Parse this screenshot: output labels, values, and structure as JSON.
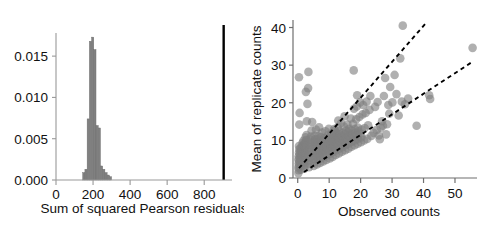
{
  "figure": {
    "panels": [
      "histogram-panel",
      "scatter-panel"
    ]
  },
  "chart_data": [
    {
      "type": "bar",
      "name": "histogram-of-sum-of-squared-pearson-residuals",
      "title": "",
      "xlabel": "Sum of squared Pearson residuals",
      "ylabel": "",
      "xlim": [
        0,
        950
      ],
      "ylim": [
        0,
        0.0178
      ],
      "xticks": [
        0,
        200,
        400,
        600,
        800
      ],
      "xticklabels": [
        "0",
        "200",
        "400",
        "600",
        "800"
      ],
      "yticks": [
        0.0,
        0.005,
        0.01,
        0.015
      ],
      "yticklabels": [
        "0.000",
        "0.005",
        "0.010",
        "0.015"
      ],
      "grid": false,
      "legend": null,
      "bar_color": "#808080",
      "bin_width": 12,
      "bin_left_edges": [
        144,
        156,
        168,
        180,
        192,
        204,
        216,
        228,
        240,
        252,
        264,
        276,
        288
      ],
      "values": [
        0.0009,
        0.0013,
        0.0074,
        0.0168,
        0.0173,
        0.0158,
        0.0066,
        0.0063,
        0.0017,
        0.0013,
        0.0009,
        0.0006,
        0.0004
      ],
      "annotations": [
        {
          "name": "observed-statistic-line",
          "type": "vertical-line",
          "x": 905,
          "color": "#000000",
          "label": ""
        }
      ]
    },
    {
      "type": "scatter",
      "name": "mean-replicate-counts-vs-observed-counts",
      "title": "",
      "xlabel": "Observed counts",
      "ylabel": "Mean of replicate counts",
      "xlim": [
        -1.5,
        57
      ],
      "ylim": [
        0,
        42
      ],
      "xticks": [
        0,
        10,
        20,
        30,
        40,
        50
      ],
      "xticklabels": [
        "0",
        "10",
        "20",
        "30",
        "40",
        "50"
      ],
      "yticks": [
        0,
        10,
        20,
        30,
        40
      ],
      "yticklabels": [
        "0",
        "10",
        "20",
        "30",
        "40"
      ],
      "grid": false,
      "legend": null,
      "marker_color": "#808080",
      "marker_opacity": 0.62,
      "marker_size": 6.2,
      "points": [
        [
          0.2,
          1.3
        ],
        [
          0.3,
          2.1
        ],
        [
          0.2,
          2.8
        ],
        [
          0.4,
          3.3
        ],
        [
          0.3,
          3.9
        ],
        [
          0.5,
          4.4
        ],
        [
          0.2,
          4.9
        ],
        [
          0.6,
          5.3
        ],
        [
          0.3,
          5.8
        ],
        [
          0.7,
          6.2
        ],
        [
          0.4,
          6.7
        ],
        [
          0.8,
          7.1
        ],
        [
          0.5,
          7.6
        ],
        [
          0.9,
          8.0
        ],
        [
          0.4,
          8.5
        ],
        [
          1.0,
          2.2
        ],
        [
          1.1,
          3.0
        ],
        [
          1.2,
          3.7
        ],
        [
          1.0,
          4.3
        ],
        [
          1.3,
          4.8
        ],
        [
          1.1,
          5.4
        ],
        [
          1.4,
          5.9
        ],
        [
          1.2,
          6.4
        ],
        [
          1.5,
          6.9
        ],
        [
          1.3,
          7.3
        ],
        [
          1.6,
          7.8
        ],
        [
          1.4,
          8.3
        ],
        [
          1.7,
          8.8
        ],
        [
          1.5,
          9.3
        ],
        [
          1.8,
          9.9
        ],
        [
          0.5,
          14.2
        ],
        [
          0.6,
          17.3
        ],
        [
          0.4,
          26.8
        ],
        [
          2.1,
          2.5
        ],
        [
          2.2,
          3.4
        ],
        [
          2.0,
          4.1
        ],
        [
          2.3,
          4.8
        ],
        [
          2.1,
          5.5
        ],
        [
          2.4,
          6.1
        ],
        [
          2.2,
          6.8
        ],
        [
          2.5,
          7.4
        ],
        [
          2.3,
          8.1
        ],
        [
          2.6,
          8.7
        ],
        [
          2.4,
          9.4
        ],
        [
          2.7,
          10.1
        ],
        [
          2.5,
          10.8
        ],
        [
          2.8,
          11.4
        ],
        [
          2.9,
          15.1
        ],
        [
          3.1,
          19.7
        ],
        [
          2.6,
          22.9
        ],
        [
          3.3,
          23.9
        ],
        [
          3.4,
          28.2
        ],
        [
          3.6,
          2.9
        ],
        [
          3.7,
          3.8
        ],
        [
          3.5,
          4.6
        ],
        [
          3.8,
          5.3
        ],
        [
          3.6,
          6.1
        ],
        [
          3.9,
          6.8
        ],
        [
          3.7,
          7.5
        ],
        [
          4.0,
          8.2
        ],
        [
          3.8,
          8.9
        ],
        [
          4.1,
          9.6
        ],
        [
          3.9,
          10.3
        ],
        [
          4.2,
          11.0
        ],
        [
          4.4,
          12.6
        ],
        [
          4.6,
          14.9
        ],
        [
          5.1,
          3.2
        ],
        [
          5.2,
          4.2
        ],
        [
          5.0,
          5.1
        ],
        [
          5.3,
          5.9
        ],
        [
          5.1,
          6.7
        ],
        [
          5.4,
          7.4
        ],
        [
          5.2,
          8.2
        ],
        [
          5.5,
          8.9
        ],
        [
          5.3,
          9.7
        ],
        [
          5.6,
          10.4
        ],
        [
          5.4,
          11.2
        ],
        [
          5.8,
          12.9
        ],
        [
          6.1,
          3.6
        ],
        [
          6.2,
          4.7
        ],
        [
          6.0,
          5.6
        ],
        [
          6.3,
          6.4
        ],
        [
          6.1,
          7.2
        ],
        [
          6.4,
          8.0
        ],
        [
          6.2,
          8.8
        ],
        [
          6.5,
          9.5
        ],
        [
          6.3,
          10.3
        ],
        [
          6.6,
          11.1
        ],
        [
          6.8,
          13.5
        ],
        [
          7.1,
          4.0
        ],
        [
          7.2,
          5.1
        ],
        [
          7.0,
          6.0
        ],
        [
          7.3,
          6.9
        ],
        [
          7.1,
          7.7
        ],
        [
          7.4,
          8.5
        ],
        [
          7.2,
          9.3
        ],
        [
          7.5,
          10.1
        ],
        [
          7.3,
          10.9
        ],
        [
          7.7,
          12.1
        ],
        [
          8.1,
          4.4
        ],
        [
          8.2,
          5.5
        ],
        [
          8.0,
          6.5
        ],
        [
          8.3,
          7.4
        ],
        [
          8.1,
          8.2
        ],
        [
          8.4,
          9.0
        ],
        [
          8.2,
          9.8
        ],
        [
          8.5,
          10.6
        ],
        [
          8.8,
          12.4
        ],
        [
          9.1,
          4.8
        ],
        [
          9.2,
          6.0
        ],
        [
          9.0,
          7.0
        ],
        [
          9.3,
          7.9
        ],
        [
          9.1,
          8.7
        ],
        [
          9.4,
          9.5
        ],
        [
          9.2,
          10.4
        ],
        [
          9.6,
          11.3
        ],
        [
          9.9,
          13.1
        ],
        [
          10.2,
          5.2
        ],
        [
          10.3,
          6.4
        ],
        [
          10.1,
          7.4
        ],
        [
          10.4,
          8.3
        ],
        [
          10.2,
          9.2
        ],
        [
          10.5,
          10.0
        ],
        [
          10.3,
          10.9
        ],
        [
          10.7,
          11.9
        ],
        [
          11.1,
          5.6
        ],
        [
          11.2,
          6.9
        ],
        [
          11.0,
          7.9
        ],
        [
          11.3,
          8.8
        ],
        [
          11.1,
          9.7
        ],
        [
          11.4,
          10.6
        ],
        [
          11.2,
          11.5
        ],
        [
          11.8,
          12.7
        ],
        [
          11.6,
          13.0
        ],
        [
          12.1,
          6.1
        ],
        [
          12.2,
          7.3
        ],
        [
          12.0,
          8.3
        ],
        [
          12.3,
          9.3
        ],
        [
          12.1,
          10.2
        ],
        [
          12.4,
          11.1
        ],
        [
          12.2,
          12.0
        ],
        [
          12.7,
          13.4
        ],
        [
          12.9,
          15.3
        ],
        [
          13.1,
          6.5
        ],
        [
          13.2,
          7.8
        ],
        [
          13.0,
          8.8
        ],
        [
          13.3,
          9.8
        ],
        [
          13.1,
          10.7
        ],
        [
          13.4,
          11.6
        ],
        [
          13.2,
          12.5
        ],
        [
          13.8,
          14.6
        ],
        [
          14.1,
          7.0
        ],
        [
          14.2,
          8.2
        ],
        [
          14.0,
          9.2
        ],
        [
          14.3,
          10.2
        ],
        [
          14.1,
          11.2
        ],
        [
          14.4,
          12.1
        ],
        [
          14.7,
          13.7
        ],
        [
          14.9,
          16.4
        ],
        [
          15.1,
          7.4
        ],
        [
          15.2,
          8.7
        ],
        [
          15.0,
          9.7
        ],
        [
          15.3,
          10.7
        ],
        [
          15.1,
          11.7
        ],
        [
          15.4,
          12.6
        ],
        [
          15.8,
          14.2
        ],
        [
          16.1,
          7.8
        ],
        [
          16.2,
          9.1
        ],
        [
          16.0,
          10.1
        ],
        [
          16.3,
          11.1
        ],
        [
          16.1,
          12.1
        ],
        [
          16.4,
          13.1
        ],
        [
          16.9,
          15.8
        ],
        [
          17.1,
          8.3
        ],
        [
          17.2,
          9.6
        ],
        [
          17.0,
          10.6
        ],
        [
          17.3,
          11.6
        ],
        [
          17.1,
          12.6
        ],
        [
          17.6,
          14.4
        ],
        [
          17.9,
          18.4
        ],
        [
          17.8,
          28.6
        ],
        [
          18.1,
          8.7
        ],
        [
          18.2,
          10.0
        ],
        [
          18.0,
          11.0
        ],
        [
          18.3,
          12.0
        ],
        [
          18.1,
          13.0
        ],
        [
          18.6,
          15.6
        ],
        [
          18.8,
          19.0
        ],
        [
          18.9,
          22.0
        ],
        [
          19.1,
          9.1
        ],
        [
          19.2,
          10.4
        ],
        [
          19.0,
          11.4
        ],
        [
          19.3,
          12.4
        ],
        [
          19.1,
          13.4
        ],
        [
          19.6,
          16.2
        ],
        [
          19.8,
          20.1
        ],
        [
          20.1,
          9.5
        ],
        [
          20.2,
          10.8
        ],
        [
          20.0,
          11.8
        ],
        [
          20.3,
          12.9
        ],
        [
          20.6,
          16.9
        ],
        [
          20.8,
          19.4
        ],
        [
          21.1,
          10.0
        ],
        [
          21.3,
          13.3
        ],
        [
          21.6,
          17.3
        ],
        [
          21.9,
          20.3
        ],
        [
          22.1,
          10.4
        ],
        [
          22.4,
          14.0
        ],
        [
          22.8,
          18.1
        ],
        [
          23.1,
          21.8
        ],
        [
          23.4,
          11.2
        ],
        [
          24.1,
          12.0
        ],
        [
          24.6,
          18.9
        ],
        [
          25.1,
          12.8
        ],
        [
          25.4,
          20.2
        ],
        [
          25.8,
          11.3
        ],
        [
          26.1,
          10.3
        ],
        [
          26.4,
          13.4
        ],
        [
          26.8,
          15.1
        ],
        [
          27.1,
          13.9
        ],
        [
          27.4,
          21.8
        ],
        [
          27.8,
          26.6
        ],
        [
          28.1,
          11.6
        ],
        [
          28.4,
          14.3
        ],
        [
          28.8,
          19.4
        ],
        [
          29.1,
          17.1
        ],
        [
          29.4,
          24.2
        ],
        [
          30.1,
          20.1
        ],
        [
          30.8,
          27.4
        ],
        [
          31.4,
          22.3
        ],
        [
          32.1,
          16.6
        ],
        [
          32.6,
          31.8
        ],
        [
          33.1,
          20.3
        ],
        [
          33.4,
          40.5
        ],
        [
          34.1,
          19.6
        ],
        [
          35.1,
          21.1
        ],
        [
          37.8,
          13.9
        ],
        [
          41.8,
          22.0
        ],
        [
          42.1,
          21.0
        ],
        [
          55.6,
          34.6
        ]
      ],
      "dense_cluster_note": "overplotted dark region near origin",
      "trend_lines": [
        {
          "name": "steep-dashed-trend-line",
          "style": "dashed",
          "color": "#000000",
          "x0": 0.4,
          "y0": 2.6,
          "x1": 41.2,
          "y1": 41.6
        },
        {
          "name": "shallow-dashed-trend-line",
          "style": "dashed",
          "color": "#000000",
          "x0": 2.0,
          "y0": 1.6,
          "x1": 55.0,
          "y1": 30.6
        }
      ]
    }
  ]
}
